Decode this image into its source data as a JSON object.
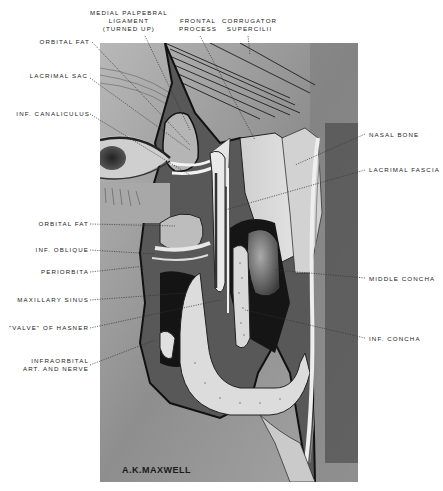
{
  "figure": {
    "signature": "A.K.MAXWELL"
  },
  "labels": {
    "top": [
      {
        "id": "medial-palpebral-ligament",
        "lines": [
          "MEDIAL PALPEBRAL",
          "LIGAMENT",
          "(TURNED UP)"
        ]
      },
      {
        "id": "frontal-process",
        "lines": [
          "FRONTAL",
          "PROCESS"
        ]
      },
      {
        "id": "corrugator-supercilii",
        "lines": [
          "CORRUGATOR",
          "SUPERCILII"
        ]
      }
    ],
    "left": [
      {
        "id": "orbital-fat-upper",
        "text": "ORBITAL FAT"
      },
      {
        "id": "lacrimal-sac",
        "text": "LACRIMAL SAC"
      },
      {
        "id": "inf-canaliculus",
        "text": "INF. CANALICULUS"
      },
      {
        "id": "orbital-fat-lower",
        "text": "ORBITAL FAT"
      },
      {
        "id": "inf-oblique",
        "text": "INF. OBLIQUE"
      },
      {
        "id": "periorbita",
        "text": "PERIORBITA"
      },
      {
        "id": "maxillary-sinus",
        "text": "MAXILLARY SINUS"
      },
      {
        "id": "valve-of-hasner",
        "text": "\"VALVE\" OF HASNER"
      },
      {
        "id": "infraorbital-art-nerve",
        "lines": [
          "INFRAORBITAL",
          "ART. AND NERVE"
        ]
      }
    ],
    "right": [
      {
        "id": "nasal-bone",
        "text": "NASAL BONE"
      },
      {
        "id": "lacrimal-fascia",
        "text": "LACRIMAL FASCIA"
      },
      {
        "id": "middle-concha",
        "text": "MIDDLE CONCHA"
      },
      {
        "id": "inf-concha",
        "text": "INF. CONCHA"
      }
    ]
  },
  "colors": {
    "background": "#ffffff",
    "ink": "#222222",
    "skin": "#9a9a9a",
    "dark_cavity": "#141414",
    "bone": "#d8d8d8"
  }
}
